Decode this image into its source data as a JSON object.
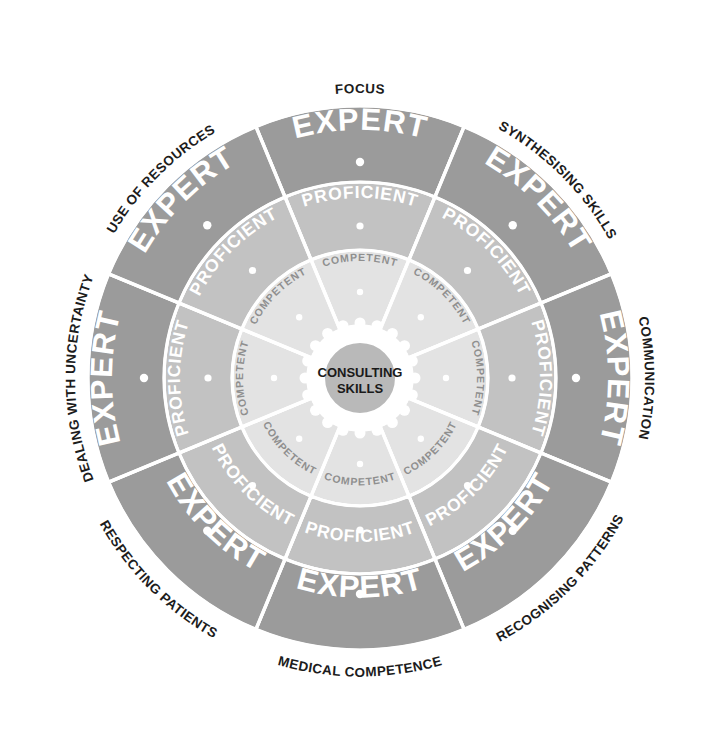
{
  "diagram": {
    "hub": {
      "line1": "CONSULTING",
      "line2": "SKILLS"
    },
    "levels": [
      {
        "key": "competent",
        "label": "COMPETENT",
        "ring": "inner",
        "color": "#e3e3e3",
        "text_color": "#8f8f8f"
      },
      {
        "key": "proficient",
        "label": "PROFICIENT",
        "ring": "middle",
        "color": "#c2c2c2",
        "text_color": "#ffffff"
      },
      {
        "key": "expert",
        "label": "EXPERT",
        "ring": "outer",
        "color": "#9b9b9b",
        "text_color": "#ffffff"
      }
    ],
    "sectors": [
      {
        "index": 0,
        "label": "FOCUS"
      },
      {
        "index": 1,
        "label": "SYNTHESISING SKILLS"
      },
      {
        "index": 2,
        "label": "COMMUNICATION"
      },
      {
        "index": 3,
        "label": "RECOGNISING PATTERNS"
      },
      {
        "index": 4,
        "label": "MEDICAL COMPETENCE"
      },
      {
        "index": 5,
        "label": "RESPECTING PATIENTS"
      },
      {
        "index": 6,
        "label": "DEALING WITH UNCERTAINTY"
      },
      {
        "index": 7,
        "label": "USE OF RESOURCES"
      }
    ],
    "colors": {
      "background": "#ffffff",
      "expert_ring": "#9b9b9b",
      "proficient_ring": "#c2c2c2",
      "competent_ring": "#e3e3e3",
      "hub": "#b9b9b9",
      "separator": "#ffffff",
      "outer_label": "#1c1c1c"
    },
    "geometry": {
      "center_x": 360,
      "center_y": 378,
      "outer_radius": 272,
      "expert_inner_radius": 196,
      "proficient_inner_radius": 128,
      "competent_inner_radius": 52,
      "hub_radius": 42,
      "sector_count": 8
    }
  }
}
